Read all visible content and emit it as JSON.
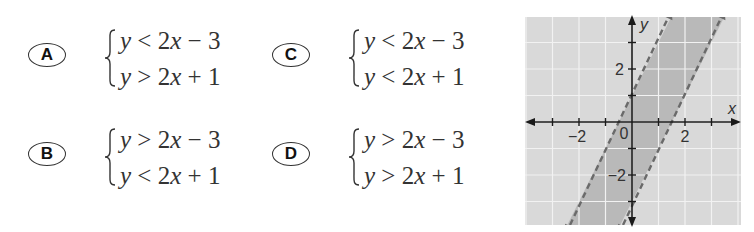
{
  "choices": [
    {
      "id": "A",
      "label": "A",
      "ineq1": {
        "lhs": "y",
        "op": "<",
        "rhs": "2x − 3"
      },
      "ineq2": {
        "lhs": "y",
        "op": ">",
        "rhs": "2x + 1"
      }
    },
    {
      "id": "B",
      "label": "B",
      "ineq1": {
        "lhs": "y",
        "op": ">",
        "rhs": "2x − 3"
      },
      "ineq2": {
        "lhs": "y",
        "op": "<",
        "rhs": "2x + 1"
      }
    },
    {
      "id": "C",
      "label": "C",
      "ineq1": {
        "lhs": "y",
        "op": "<",
        "rhs": "2x − 3"
      },
      "ineq2": {
        "lhs": "y",
        "op": "<",
        "rhs": "2x + 1"
      }
    },
    {
      "id": "D",
      "label": "D",
      "ineq1": {
        "lhs": "y",
        "op": ">",
        "rhs": "2x − 3"
      },
      "ineq2": {
        "lhs": "y",
        "op": ">",
        "rhs": "2x + 1"
      }
    }
  ],
  "graph": {
    "x_axis_label": "x",
    "y_axis_label": "y",
    "origin_label": "0",
    "x_tick_labels": [
      "−2",
      "2"
    ],
    "y_tick_labels": [
      "2",
      "−2"
    ],
    "colors": {
      "background": "#d9d9d9",
      "shaded_band": "#b9b9b9",
      "grid": "#f2f2f2",
      "boundary_line": "#6a6a6a",
      "axis": "#1a1a1a"
    }
  },
  "chart_data": {
    "type": "line",
    "title": "",
    "xlabel": "x",
    "ylabel": "y",
    "xlim": [
      -4,
      4
    ],
    "ylim": [
      -4,
      4
    ],
    "grid": true,
    "x_ticks": [
      -3,
      -2,
      -1,
      1,
      2,
      3
    ],
    "y_ticks": [
      -3,
      -2,
      -1,
      1,
      2,
      3
    ],
    "x_tick_labels": {
      "-2": "−2",
      "2": "2"
    },
    "y_tick_labels": {
      "2": "2",
      "-2": "−2"
    },
    "series": [
      {
        "name": "y = 2x + 1",
        "style": "dashed",
        "points": [
          [
            -2.5,
            -4
          ],
          [
            1.5,
            4
          ]
        ]
      },
      {
        "name": "y = 2x − 3",
        "style": "dashed",
        "points": [
          [
            -0.5,
            -4
          ],
          [
            3.5,
            4
          ]
        ]
      }
    ],
    "shaded_region": "between lines: 2x − 3 < y < 2x + 1",
    "annotations": [
      "0"
    ]
  }
}
